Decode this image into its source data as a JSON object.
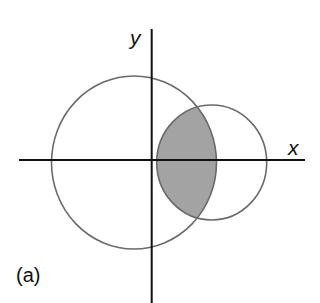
{
  "figure": {
    "panel_label": "(a)",
    "x_axis_label": "x",
    "y_axis_label": "y"
  },
  "geometry": {
    "origin": [
      151.7,
      160
    ],
    "x_axis": {
      "from": [
        19,
        160
      ],
      "to": [
        305,
        160
      ]
    },
    "y_axis": {
      "from": [
        151.7,
        29
      ],
      "to": [
        151.7,
        303
      ]
    },
    "large_circle": {
      "cx": 134,
      "cy": 162.5,
      "rx": 82.5,
      "ry": 86.5
    },
    "small_circle": {
      "cx": 211.7,
      "cy": 162.5,
      "rx": 55,
      "ry": 57.5
    },
    "shaded_region": "intersection of large and small circle"
  },
  "colors": {
    "background": "#ffffff",
    "axes": "#111111",
    "circle_stroke": "#6a6a6a",
    "shaded_fill": "#a3a3a3",
    "text": "#111111"
  }
}
